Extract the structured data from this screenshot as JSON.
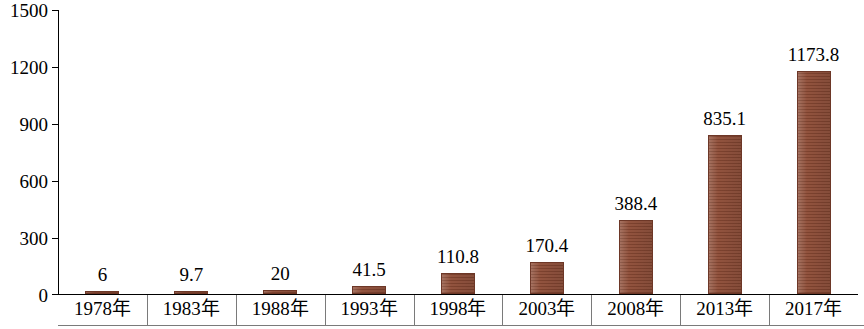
{
  "chart_data": {
    "type": "bar",
    "title": "",
    "subtitle": "",
    "xlabel": "",
    "ylabel": "",
    "categories": [
      "1978年",
      "1983年",
      "1988年",
      "1993年",
      "1998年",
      "2003年",
      "2008年",
      "2013年",
      "2017年"
    ],
    "values": [
      6,
      9.7,
      20,
      41.5,
      110.8,
      170.4,
      388.4,
      835.1,
      1173.8
    ],
    "value_labels": [
      "6",
      "9.7",
      "20",
      "41.5",
      "110.8",
      "170.4",
      "388.4",
      "835.1",
      "1173.8"
    ],
    "ylim": [
      0,
      1500
    ],
    "yticks": [
      0,
      300,
      600,
      900,
      1200,
      1500
    ],
    "ytick_labels": [
      "0",
      "300",
      "600",
      "900",
      "1200",
      "1500"
    ],
    "grid": false,
    "legend": null,
    "series": [
      {
        "name": "",
        "values": [
          6,
          9.7,
          20,
          41.5,
          110.8,
          170.4,
          388.4,
          835.1,
          1173.8
        ],
        "color": "#8c4a34"
      }
    ],
    "bar_color": "#8c4a34",
    "axis_color": "#000000"
  }
}
